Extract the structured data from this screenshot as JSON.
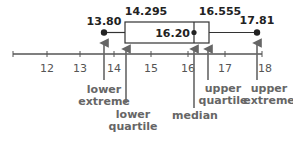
{
  "diagram": {
    "type": "box-and-whisker plot",
    "axis": {
      "ticks": [
        "12",
        "13",
        "14",
        "15",
        "16",
        "17",
        "18"
      ],
      "range": [
        11,
        18
      ]
    },
    "values": {
      "lower_extreme": "13.80",
      "lower_quartile": "14.295",
      "median": "16.20",
      "upper_quartile": "16.555",
      "upper_extreme": "17.81"
    },
    "labels": {
      "lower_extreme": [
        "lower",
        "extreme"
      ],
      "lower_quartile": [
        "lower",
        "quartile"
      ],
      "median": [
        "median"
      ],
      "upper_quartile": [
        "upper",
        "quartile"
      ],
      "upper_extreme": [
        "upper",
        "extreme"
      ]
    },
    "colors": {
      "plot": "#222222",
      "axis": "#555555",
      "arrows": "#666666",
      "labels": "#666666"
    }
  }
}
